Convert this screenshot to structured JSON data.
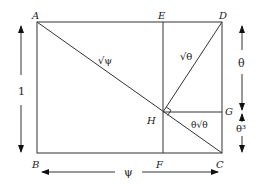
{
  "diagram": {
    "type": "geometric-construction",
    "points": {
      "A": {
        "label": "A"
      },
      "B": {
        "label": "B"
      },
      "C": {
        "label": "C"
      },
      "D": {
        "label": "D"
      },
      "E": {
        "label": "E"
      },
      "F": {
        "label": "F"
      },
      "G": {
        "label": "G"
      },
      "H": {
        "label": "H"
      }
    },
    "segment_labels": {
      "AH": "√ψ",
      "DH": "√θ",
      "HC": "θ√θ"
    },
    "dimension_labels": {
      "height": "1",
      "width": "ψ",
      "DG": "θ",
      "GC": "θ³"
    },
    "right_angle_marker": "H"
  }
}
